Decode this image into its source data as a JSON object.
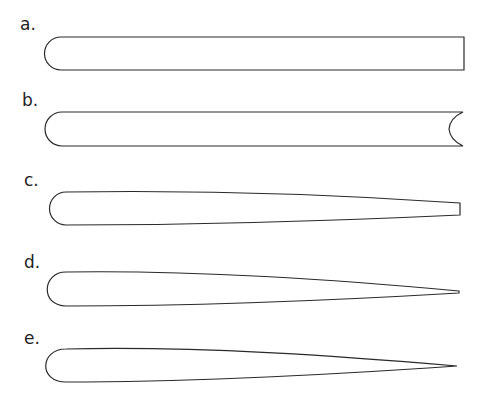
{
  "figure": {
    "shapes": [
      {
        "label": "a.",
        "form": "round-nosed bar with square flat end"
      },
      {
        "label": "b.",
        "form": "round-nosed bar with concave notched end"
      },
      {
        "label": "c.",
        "form": "round-nosed tapering bar with blunt square end"
      },
      {
        "label": "d.",
        "form": "round-nosed tapering blade with narrow pointed end"
      },
      {
        "label": "e.",
        "form": "round-nosed tapering blade with sharp pointed end"
      }
    ],
    "stroke_color": "#2a2a2a",
    "background_color": "#ffffff"
  }
}
